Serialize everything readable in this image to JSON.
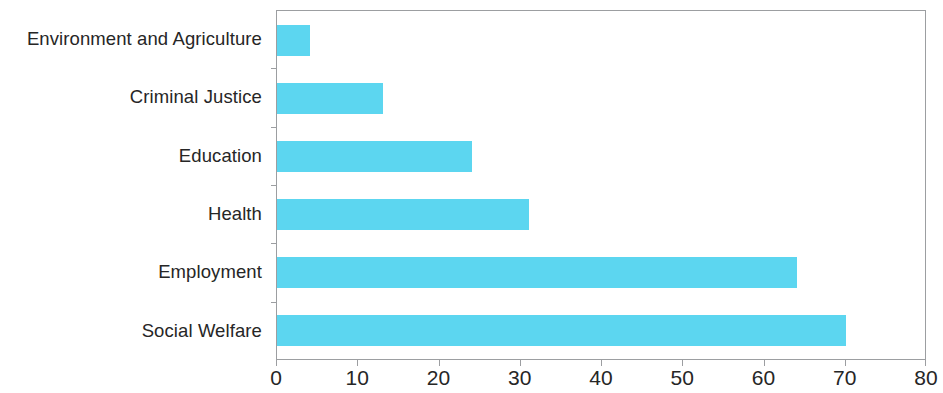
{
  "chart_data": {
    "type": "bar",
    "orientation": "horizontal",
    "title": "",
    "subtitle": "",
    "xlabel": "",
    "ylabel": "",
    "categories": [
      "Environment and Agriculture",
      "Criminal Justice",
      "Education",
      "Health",
      "Employment",
      "Social Welfare"
    ],
    "values": [
      4,
      13,
      24,
      31,
      64,
      70
    ],
    "xlim": [
      0,
      80
    ],
    "xticks": [
      0,
      10,
      20,
      30,
      40,
      50,
      60,
      70,
      80
    ],
    "xtick_labels": [
      "0",
      "10",
      "20",
      "30",
      "40",
      "50",
      "60",
      "70",
      "80"
    ],
    "grid": false,
    "legend": null,
    "bar_color": "#5CD6F0",
    "axis_color": "#9c9ea1",
    "text_color": "#262626"
  }
}
